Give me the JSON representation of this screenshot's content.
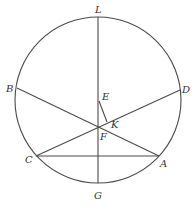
{
  "diagram": {
    "type": "geometry-circle-chords",
    "stroke_color": "#4a4a4a",
    "label_color": "#333333",
    "circle": {
      "cx": 98,
      "cy": 100,
      "r": 83
    },
    "points": {
      "L": {
        "x": 98,
        "y": 17
      },
      "G": {
        "x": 98,
        "y": 183
      },
      "B": {
        "x": 17,
        "y": 88
      },
      "D": {
        "x": 180,
        "y": 90
      },
      "C": {
        "x": 36,
        "y": 156
      },
      "A": {
        "x": 159,
        "y": 156
      },
      "E": {
        "x": 99,
        "y": 101
      },
      "K": {
        "x": 107,
        "y": 122
      },
      "F": {
        "x": 98,
        "y": 127
      }
    },
    "segments": [
      [
        "L",
        "G"
      ],
      [
        "B",
        "A"
      ],
      [
        "C",
        "D"
      ],
      [
        "C",
        "A"
      ],
      [
        "E",
        "K"
      ]
    ],
    "labels": [
      {
        "id": "L",
        "text": "L",
        "x": 95,
        "y": 13
      },
      {
        "id": "B",
        "text": "B",
        "x": 6,
        "y": 92
      },
      {
        "id": "D",
        "text": "D",
        "x": 182,
        "y": 93
      },
      {
        "id": "E",
        "text": "E",
        "x": 102,
        "y": 100
      },
      {
        "id": "K",
        "text": "K",
        "x": 111,
        "y": 128
      },
      {
        "id": "F",
        "text": "F",
        "x": 100,
        "y": 140
      },
      {
        "id": "C",
        "text": "C",
        "x": 25,
        "y": 163
      },
      {
        "id": "A",
        "text": "A",
        "x": 160,
        "y": 167
      },
      {
        "id": "G",
        "text": "G",
        "x": 94,
        "y": 199
      }
    ]
  }
}
